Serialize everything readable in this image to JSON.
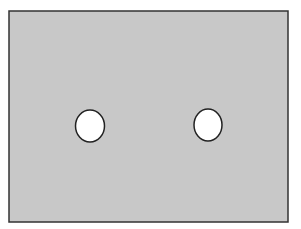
{
  "diagram": {
    "background": "#ffffff",
    "panel": {
      "x": 9,
      "y": 11,
      "width": 279,
      "height": 211,
      "fill": "#c8c8c8",
      "stroke": "#333333",
      "stroke_width": 1.5
    },
    "holes": [
      {
        "name": "left-hole",
        "cx": 90,
        "cy": 126,
        "rx": 14.5,
        "ry": 16,
        "fill": "#ffffff",
        "stroke": "#222222"
      },
      {
        "name": "right-hole",
        "cx": 208,
        "cy": 125,
        "rx": 14,
        "ry": 16,
        "fill": "#ffffff",
        "stroke": "#222222"
      }
    ]
  }
}
